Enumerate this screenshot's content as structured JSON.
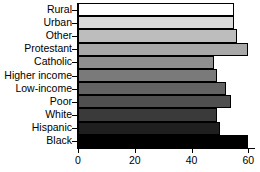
{
  "chart_data": {
    "type": "bar",
    "orientation": "horizontal",
    "title": "",
    "xlabel": "",
    "ylabel": "",
    "xlim": [
      0,
      62
    ],
    "ylim": null,
    "grid": false,
    "legend": null,
    "xticks": [
      0,
      20,
      40,
      60
    ],
    "xticklabels": [
      "0",
      "20",
      "40",
      "60"
    ],
    "categories": [
      "Rural",
      "Urban",
      "Other",
      "Protestant",
      "Catholic",
      "Higher income",
      "Low-income",
      "Poor",
      "White",
      "Hispanic",
      "Black"
    ],
    "values": [
      55,
      55,
      56,
      60,
      48,
      49,
      52,
      54,
      49,
      50,
      60
    ],
    "bar_colors": [
      "#ffffff",
      "#d9d9d9",
      "#bdbdbd",
      "#a8a8a8",
      "#8f8f8f",
      "#7a7a7a",
      "#636363",
      "#4f4f4f",
      "#3a3a3a",
      "#1f1f1f",
      "#000000"
    ],
    "bar_edge_color": "#000000"
  },
  "axes": {
    "x_tick_labels": [
      "0",
      "20",
      "40",
      "60"
    ]
  }
}
